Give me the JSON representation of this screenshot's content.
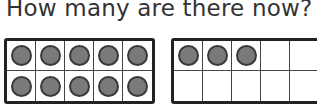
{
  "question": "How many are there now?",
  "ten_frames": [
    {
      "filled": 10,
      "rows": 2,
      "cols": 5
    },
    {
      "filled": 3,
      "rows": 2,
      "cols": 5
    }
  ],
  "colors": {
    "counter_fill": "#7a7a7a",
    "counter_border": "#3a3a3a",
    "frame_border": "#222222"
  }
}
